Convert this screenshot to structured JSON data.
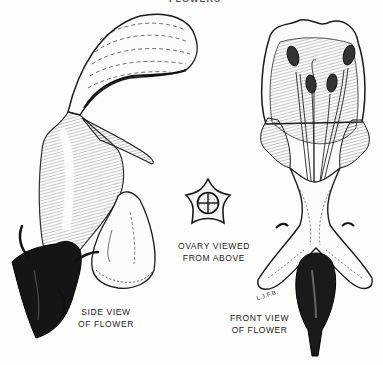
{
  "figure": {
    "header_partial": "FLOWERS",
    "background": "#fdfdfb",
    "ink": "#1a1a1a",
    "labels": {
      "side_view": [
        "SIDE VIEW",
        "OF FLOWER"
      ],
      "ovary": [
        "OVARY VIEWED",
        "FROM ABOVE"
      ],
      "front_view": [
        "FRONT VIEW",
        "OF FLOWER"
      ]
    },
    "signature": "L.J.F.B."
  }
}
